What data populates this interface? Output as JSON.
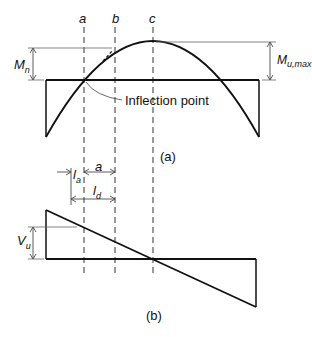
{
  "section_labels": {
    "a": "a",
    "b": "b",
    "c": "c"
  },
  "moment_diagram": {
    "caption": "(a)",
    "m_n_label": "M",
    "m_n_sub": "n",
    "m_u_max_label": "M",
    "m_u_max_sub": "u,max",
    "inflection_label": "Inflection point"
  },
  "shear_diagram": {
    "caption": "(b)",
    "v_u_label": "V",
    "v_u_sub": "u",
    "l_a_label": "l",
    "l_a_sub": "a",
    "a_label": "a",
    "l_d_label": "l",
    "l_d_sub": "d"
  },
  "colors": {
    "line": "#111111",
    "dim": "#555555"
  }
}
